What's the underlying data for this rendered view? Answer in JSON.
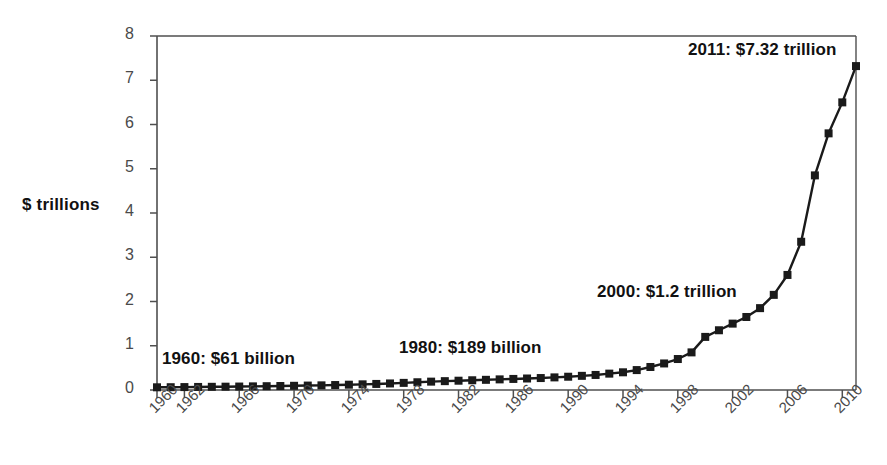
{
  "chart_data": {
    "type": "line",
    "title": "",
    "subtitle": "",
    "xlabel": "",
    "ylabel": "$ trillions",
    "xlim": [
      1960,
      2011
    ],
    "ylim": [
      0,
      8
    ],
    "grid": false,
    "legend": "none",
    "marker": "square",
    "line_color": "#1a1a1a",
    "marker_color": "#1a1a1a",
    "y_ticks": [
      0,
      1,
      2,
      3,
      4,
      5,
      6,
      7,
      8
    ],
    "y_tick_labels": [
      "0",
      "1",
      "2",
      "3",
      "4",
      "5",
      "6",
      "7",
      "8"
    ],
    "x_tick_labels": [
      "1960",
      "1962",
      "1966",
      "1970",
      "1974",
      "1978",
      "1982",
      "1986",
      "1990",
      "1994",
      "1998",
      "2002",
      "2006",
      "2010"
    ],
    "x_tick_years": [
      1960,
      1962,
      1966,
      1970,
      1974,
      1978,
      1982,
      1986,
      1990,
      1994,
      1998,
      2002,
      2006,
      2010
    ],
    "x": [
      1960,
      1961,
      1962,
      1963,
      1964,
      1965,
      1966,
      1967,
      1968,
      1969,
      1970,
      1971,
      1972,
      1973,
      1974,
      1975,
      1976,
      1977,
      1978,
      1979,
      1980,
      1981,
      1982,
      1983,
      1984,
      1985,
      1986,
      1987,
      1988,
      1989,
      1990,
      1991,
      1992,
      1993,
      1994,
      1995,
      1996,
      1997,
      1998,
      1999,
      2000,
      2001,
      2002,
      2003,
      2004,
      2005,
      2006,
      2007,
      2008,
      2009,
      2010,
      2011
    ],
    "values": [
      0.061,
      0.063,
      0.066,
      0.069,
      0.072,
      0.075,
      0.078,
      0.082,
      0.086,
      0.09,
      0.095,
      0.1,
      0.105,
      0.112,
      0.12,
      0.128,
      0.137,
      0.148,
      0.161,
      0.175,
      0.189,
      0.2,
      0.21,
      0.22,
      0.23,
      0.24,
      0.25,
      0.26,
      0.27,
      0.285,
      0.3,
      0.32,
      0.34,
      0.37,
      0.4,
      0.45,
      0.52,
      0.6,
      0.7,
      0.85,
      1.2,
      1.35,
      1.5,
      1.65,
      1.85,
      2.15,
      2.6,
      3.35,
      4.85,
      5.8,
      6.5,
      7.32
    ],
    "annotations": [
      {
        "name": "1960-callout",
        "text": "1960: $61 billion",
        "year": 1960,
        "value": 0.061
      },
      {
        "name": "1980-callout",
        "text": "1980: $189 billion",
        "year": 1980,
        "value": 0.189
      },
      {
        "name": "2000-callout",
        "text": "2000: $1.2 trillion",
        "year": 2000,
        "value": 1.2
      },
      {
        "name": "2011-callout",
        "text": "2011: $7.32 trillion",
        "year": 2011,
        "value": 7.32
      }
    ]
  }
}
